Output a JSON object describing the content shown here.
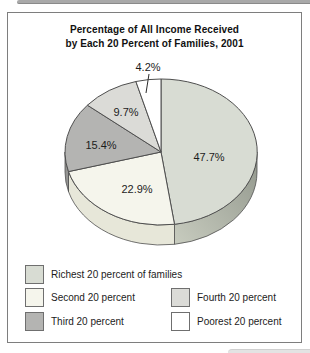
{
  "chart_data": {
    "type": "pie",
    "title": "Percentage of All Income Received by Each 20 Percent of Families, 2001",
    "title_lines": [
      "Percentage of All Income Received",
      "by Each 20 Percent of Families, 2001"
    ],
    "categories": [
      "Richest 20 percent of families",
      "Second 20 percent",
      "Third 20 percent",
      "Fourth 20 percent",
      "Poorest 20 percent"
    ],
    "values": [
      47.7,
      22.9,
      15.4,
      9.7,
      4.2
    ],
    "legend_position": "bottom",
    "outline_color": "#4f4f4f",
    "style": "3d-ellipse",
    "slices": [
      {
        "label": "Richest 20 percent of families",
        "value": 47.7,
        "pct_label": "47.7%",
        "color": "#d8dcd3",
        "rim_color": "#a9ae9f",
        "label_pos": {
          "x": 209,
          "y": 157
        }
      },
      {
        "label": "Second 20 percent",
        "value": 22.9,
        "pct_label": "22.9%",
        "color": "#f5f5ec",
        "rim_color": "#e7e7d9",
        "label_pos": {
          "x": 137,
          "y": 189
        }
      },
      {
        "label": "Third 20 percent",
        "value": 15.4,
        "pct_label": "15.4%",
        "color": "#b4b4b2",
        "rim_color": "#949492",
        "label_pos": {
          "x": 101,
          "y": 145
        }
      },
      {
        "label": "Fourth 20 percent",
        "value": 9.7,
        "pct_label": "9.7%",
        "color": "#dbdbd7",
        "rim_color": "#c0c0bc",
        "label_pos": {
          "x": 126,
          "y": 112
        }
      },
      {
        "label": "Poorest 20 percent",
        "value": 4.2,
        "pct_label": "4.2%",
        "color": "#ffffff",
        "rim_color": "#e9e9e9",
        "label_pos": {
          "x": 148,
          "y": 67
        }
      }
    ],
    "geometry": {
      "cx": 161,
      "cy": 152,
      "rx": 96,
      "ry": 73,
      "depth": 20,
      "start_angle_deg": 0,
      "clockwise": true
    },
    "callout": {
      "from": {
        "x": 149,
        "y": 74
      },
      "to": {
        "x": 146,
        "y": 93
      }
    }
  }
}
